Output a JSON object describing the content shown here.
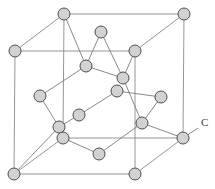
{
  "diagram": {
    "label": {
      "text": "C",
      "x": 201,
      "y": 126,
      "leader": [
        183,
        138,
        198,
        128
      ]
    },
    "colors": {
      "atom_fill": "#d2d2d2",
      "atom_stroke": "#4e4e4e",
      "line": "#808080"
    },
    "atom_radius": 6,
    "atoms": [
      [
        64,
        14
      ],
      [
        184,
        14
      ],
      [
        15,
        51
      ],
      [
        135,
        51
      ],
      [
        101,
        32
      ],
      [
        86,
        66
      ],
      [
        123,
        78
      ],
      [
        117,
        91
      ],
      [
        40,
        96
      ],
      [
        161,
        97
      ],
      [
        79,
        115
      ],
      [
        142,
        123
      ],
      [
        59,
        127
      ],
      [
        63,
        138
      ],
      [
        183,
        138
      ],
      [
        99,
        154
      ],
      [
        14,
        174
      ],
      [
        135,
        174
      ]
    ],
    "cube_edges": [
      [
        64,
        14,
        184,
        14
      ],
      [
        184,
        14,
        183,
        138
      ],
      [
        183,
        138,
        63,
        138
      ],
      [
        63,
        138,
        64,
        14
      ],
      [
        15,
        51,
        135,
        51
      ],
      [
        135,
        51,
        135,
        174
      ],
      [
        135,
        174,
        14,
        174
      ],
      [
        14,
        174,
        15,
        51
      ],
      [
        15,
        51,
        64,
        14
      ],
      [
        135,
        51,
        184,
        14
      ],
      [
        135,
        174,
        183,
        138
      ],
      [
        14,
        174,
        63,
        138
      ]
    ],
    "bonds": [
      [
        64,
        14,
        86,
        66
      ],
      [
        101,
        32,
        86,
        66
      ],
      [
        86,
        66,
        40,
        96
      ],
      [
        86,
        66,
        123,
        78
      ],
      [
        101,
        32,
        123,
        78
      ],
      [
        135,
        51,
        123,
        78
      ],
      [
        123,
        78,
        142,
        123
      ],
      [
        117,
        91,
        79,
        115
      ],
      [
        117,
        91,
        161,
        97
      ],
      [
        161,
        97,
        142,
        123
      ],
      [
        142,
        123,
        183,
        138
      ],
      [
        142,
        123,
        99,
        154
      ],
      [
        99,
        154,
        63,
        138
      ],
      [
        40,
        96,
        59,
        127
      ],
      [
        59,
        127,
        79,
        115
      ],
      [
        14,
        174,
        59,
        127
      ]
    ]
  }
}
